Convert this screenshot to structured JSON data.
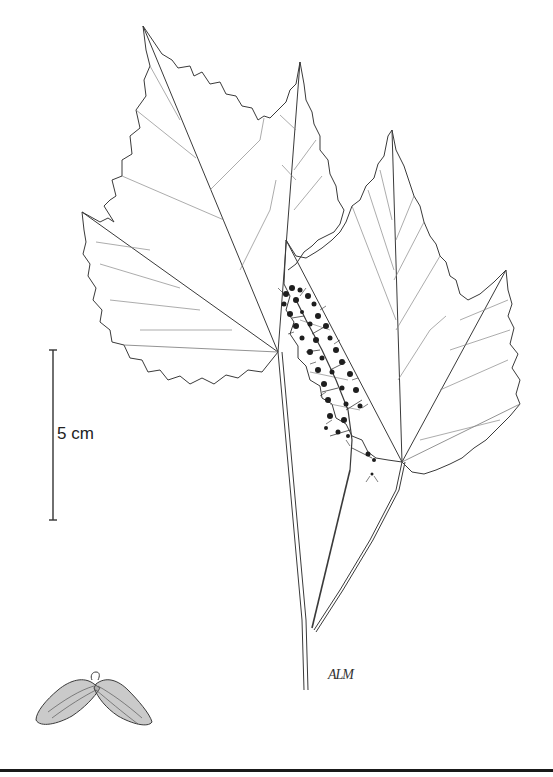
{
  "illustration": {
    "subject": "botanical line drawing of a maple branch",
    "elements": [
      "three serrated leaves",
      "flower raceme",
      "paired samara fruit"
    ],
    "ink_color": "#3a3a3a",
    "background_color": "#ffffff"
  },
  "scale_bar": {
    "label": "5 cm"
  },
  "signature": {
    "text": "ALM"
  }
}
